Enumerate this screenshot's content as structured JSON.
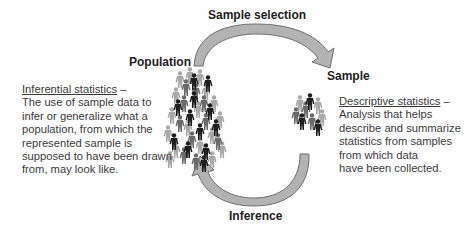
{
  "labels": {
    "sample_selection": "Sample selection",
    "population": "Population",
    "sample": "Sample",
    "inference": "Inference"
  },
  "inferential": {
    "term": "Inferential statistics",
    "dash": " –",
    "lines": [
      "The use of sample data to",
      "infer or generalize what a",
      "population, from which the",
      "represented sample is",
      "supposed to have been drawn",
      "from, may look like."
    ]
  },
  "descriptive": {
    "term": "Descriptive statistics",
    "dash": " –",
    "lines": [
      "Analysis that helps",
      "describe and summarize",
      "statistics from samples",
      "from which data",
      "have been collected."
    ]
  },
  "colors": {
    "arrow_fill": "#b3b3b3",
    "arrow_stroke": "#6e6e6e",
    "figure_dark": "#1e1e1e",
    "figure_mid": "#6a6a6a",
    "figure_light": "#a8a8a8"
  }
}
